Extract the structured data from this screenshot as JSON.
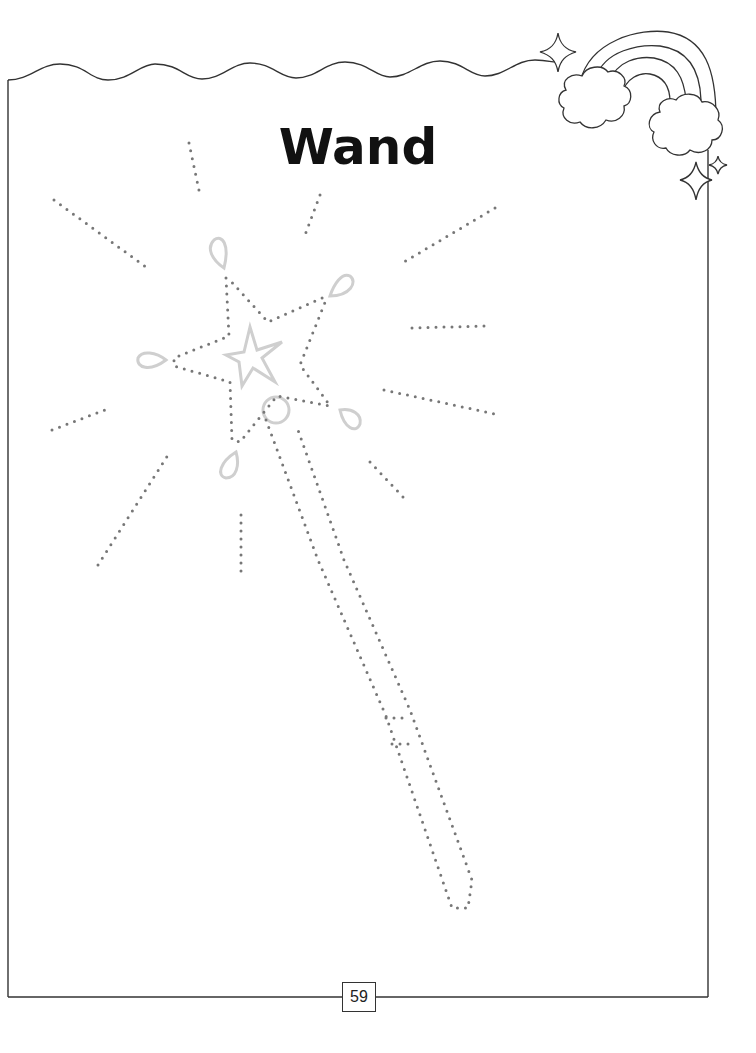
{
  "page": {
    "title": "Wand",
    "page_number": "59"
  },
  "activity": {
    "type": "dot-to-dot tracing",
    "subject": "magic wand with star and sparkle rays"
  },
  "decorations": {
    "corner_art": "rainbow with two clouds and sparkles",
    "top_border": "wavy line"
  },
  "colors": {
    "border": "#333333",
    "dots": "#777777",
    "guide_shapes": "#cfcfcf",
    "title": "#111111"
  }
}
